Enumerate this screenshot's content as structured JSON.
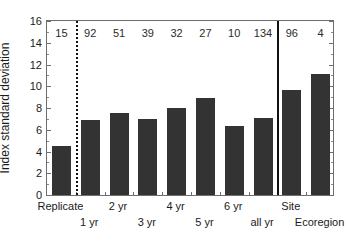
{
  "chart_data": {
    "type": "bar",
    "title": "",
    "xlabel": "",
    "ylabel": "Index standard deviation",
    "ylim": [
      0,
      16
    ],
    "ytick_step": 2,
    "yticks": [
      0,
      2,
      4,
      6,
      8,
      10,
      12,
      14,
      16
    ],
    "grid": false,
    "legend": null,
    "categories": [
      "Replicate",
      "1 yr",
      "2 yr",
      "3 yr",
      "4 yr",
      "5 yr",
      "6 yr",
      "all yr",
      "Site",
      "Ecoregion"
    ],
    "values": [
      4.5,
      6.9,
      7.55,
      7.0,
      8.0,
      8.9,
      6.35,
      7.1,
      9.65,
      11.1
    ],
    "point_labels": [
      "15",
      "92",
      "51",
      "39",
      "32",
      "27",
      "10",
      "134",
      "96",
      "4"
    ],
    "annotations": [
      {
        "type": "vertical-line",
        "style": "dotted",
        "after_category": "Replicate"
      },
      {
        "type": "vertical-line",
        "style": "solid",
        "after_category": "all yr"
      }
    ],
    "bar_color": "#333333",
    "axis_color": "#6e6e6e",
    "text_color": "#1a1a1a"
  },
  "axis": {
    "y_title": "Index standard deviation",
    "y_tick_labels": [
      "0",
      "2",
      "4",
      "6",
      "8",
      "10",
      "12",
      "14",
      "16"
    ]
  },
  "x_labels_row1": [
    "Replicate",
    "2 yr",
    "4 yr",
    "6 yr",
    "Site"
  ],
  "x_labels_row2": [
    "1 yr",
    "3 yr",
    "5 yr",
    "all yr",
    "Ecoregion"
  ]
}
